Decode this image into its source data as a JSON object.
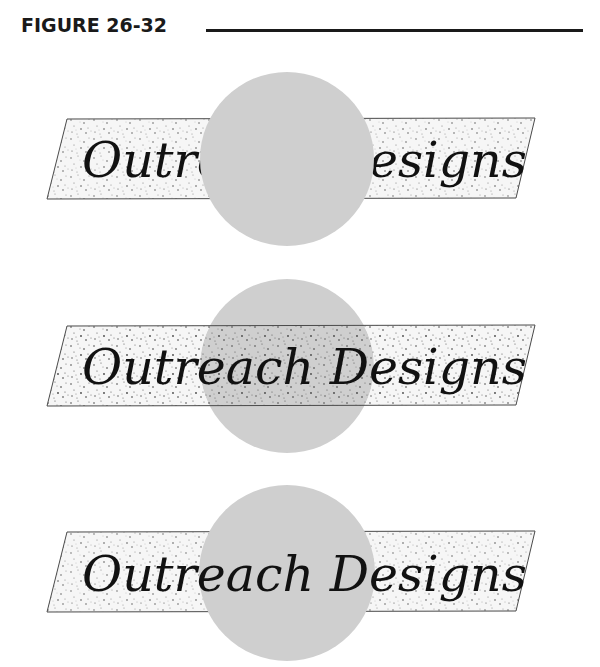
{
  "header": {
    "figure_label": "FIGURE 26-32"
  },
  "colors": {
    "circle_fill": "#cfcfcf",
    "banner_fill": "#f4f4f4",
    "banner_stroke": "#4a4a4a",
    "speckle": "#555555",
    "text": "#111111",
    "rule": "#1a1a1a"
  },
  "panels": [
    {
      "id": "panel-1",
      "description": "Circle in front of speckled banner, covering middle of text",
      "stacking": [
        "banner",
        "text",
        "circle"
      ],
      "text": "Outreach Designs"
    },
    {
      "id": "panel-2",
      "description": "Speckled banner in front of circle; circle shows through speckle",
      "stacking": [
        "circle",
        "banner",
        "text"
      ],
      "text": "Outreach Designs"
    },
    {
      "id": "panel-3",
      "description": "Circle between banner and text; text on top",
      "stacking": [
        "banner",
        "circle",
        "text"
      ],
      "text": "Outreach Designs"
    }
  ]
}
